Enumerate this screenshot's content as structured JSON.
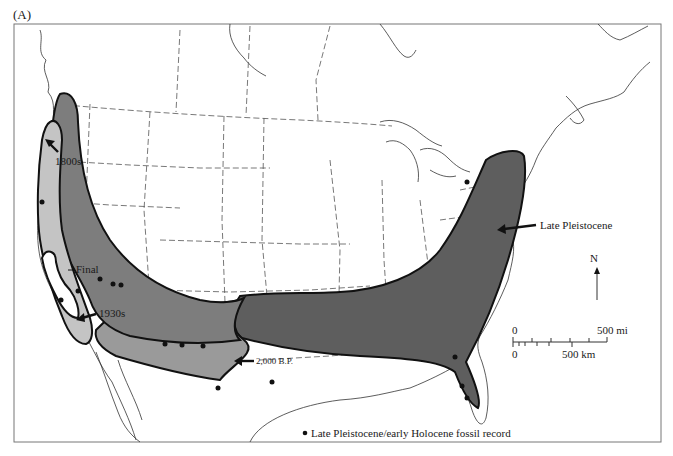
{
  "figure": {
    "panel_label": "(A)",
    "colors": {
      "late_pleistocene_range": "#5e5e5e",
      "range_2000bp": "#9a9a9a",
      "range_1800s": "#7d7d7d",
      "range_1930s": "#c4c4c4",
      "final_range": "#ffffff",
      "background": "#ffffff",
      "outline": "#111111"
    },
    "annotations": {
      "label_1800s": "1800s",
      "label_final": "Final",
      "label_1930s": "1930s",
      "label_2000bp": "2,000 B.P.",
      "label_late_pleistocene": "Late Pleistocene"
    },
    "compass": {
      "label": "N"
    },
    "scale_bar": {
      "mi_zero": "0",
      "mi_end": "500 mi",
      "km_zero": "0",
      "km_end": "500 km"
    },
    "legend": {
      "symbol": "●",
      "text": "Late Pleistocene/early Holocene fossil record"
    }
  }
}
